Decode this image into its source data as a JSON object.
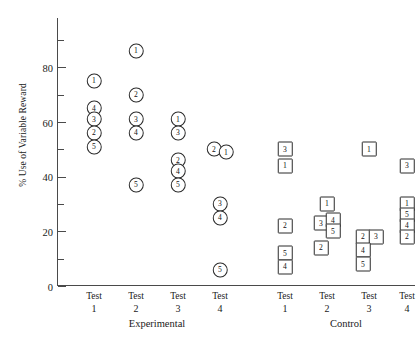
{
  "chart_data": {
    "type": "scatter",
    "title": "",
    "xlabel": "",
    "ylabel": "% Use of Variable Reward",
    "ylim": [
      0,
      90
    ],
    "yticks_major": [
      0,
      20,
      40,
      60,
      80
    ],
    "yticks_minor": [
      10,
      30,
      50,
      70,
      90
    ],
    "ytick_labels": [
      "0",
      "20",
      "40",
      "60",
      "80"
    ],
    "grid": false,
    "legend_position": "none",
    "x_categories": [
      {
        "line1": "Test",
        "line2": "1",
        "group": "Experimental",
        "marker": "circle"
      },
      {
        "line1": "Test",
        "line2": "2",
        "group": "Experimental",
        "marker": "circle"
      },
      {
        "line1": "Test",
        "line2": "3",
        "group": "Experimental",
        "marker": "circle"
      },
      {
        "line1": "Test",
        "line2": "4",
        "group": "Experimental",
        "marker": "circle"
      },
      {
        "line1": "Test",
        "line2": "1",
        "group": "Control",
        "marker": "square"
      },
      {
        "line1": "Test",
        "line2": "2",
        "group": "Control",
        "marker": "square"
      },
      {
        "line1": "Test",
        "line2": "3",
        "group": "Control",
        "marker": "square"
      },
      {
        "line1": "Test",
        "line2": "4",
        "group": "Control",
        "marker": "square"
      }
    ],
    "group_labels": [
      "Experimental",
      "Control"
    ],
    "points": [
      {
        "col": 0,
        "value": 75,
        "label": "1",
        "marker": "circle",
        "offset": 0
      },
      {
        "col": 0,
        "value": 65,
        "label": "4",
        "marker": "circle",
        "offset": 0
      },
      {
        "col": 0,
        "value": 61,
        "label": "3",
        "marker": "circle",
        "offset": 0
      },
      {
        "col": 0,
        "value": 56,
        "label": "2",
        "marker": "circle",
        "offset": 0
      },
      {
        "col": 0,
        "value": 51,
        "label": "5",
        "marker": "circle",
        "offset": 0
      },
      {
        "col": 1,
        "value": 86,
        "label": "1",
        "marker": "circle",
        "offset": 0
      },
      {
        "col": 1,
        "value": 70,
        "label": "2",
        "marker": "circle",
        "offset": 0
      },
      {
        "col": 1,
        "value": 61,
        "label": "3",
        "marker": "circle",
        "offset": 0
      },
      {
        "col": 1,
        "value": 56,
        "label": "4",
        "marker": "circle",
        "offset": 0
      },
      {
        "col": 1,
        "value": 37,
        "label": "5",
        "marker": "circle",
        "offset": 0
      },
      {
        "col": 2,
        "value": 61,
        "label": "1",
        "marker": "circle",
        "offset": 0
      },
      {
        "col": 2,
        "value": 56,
        "label": "3",
        "marker": "circle",
        "offset": 0
      },
      {
        "col": 2,
        "value": 46,
        "label": "2",
        "marker": "circle",
        "offset": 0
      },
      {
        "col": 2,
        "value": 42,
        "label": "4",
        "marker": "circle",
        "offset": 0
      },
      {
        "col": 2,
        "value": 37,
        "label": "5",
        "marker": "circle",
        "offset": 0
      },
      {
        "col": 3,
        "value": 50,
        "label": "2",
        "marker": "circle",
        "offset": -6
      },
      {
        "col": 3,
        "value": 49,
        "label": "1",
        "marker": "circle",
        "offset": 6
      },
      {
        "col": 3,
        "value": 30,
        "label": "3",
        "marker": "circle",
        "offset": 0
      },
      {
        "col": 3,
        "value": 25,
        "label": "4",
        "marker": "circle",
        "offset": 0
      },
      {
        "col": 3,
        "value": 6,
        "label": "5",
        "marker": "circle",
        "offset": 0
      },
      {
        "col": 4,
        "value": 50,
        "label": "3",
        "marker": "square",
        "offset": 0
      },
      {
        "col": 4,
        "value": 44,
        "label": "1",
        "marker": "square",
        "offset": 0
      },
      {
        "col": 4,
        "value": 22,
        "label": "2",
        "marker": "square",
        "offset": 0
      },
      {
        "col": 4,
        "value": 12,
        "label": "5",
        "marker": "square",
        "offset": 0
      },
      {
        "col": 4,
        "value": 7,
        "label": "4",
        "marker": "square",
        "offset": 0
      },
      {
        "col": 5,
        "value": 30,
        "label": "1",
        "marker": "square",
        "offset": 0
      },
      {
        "col": 5,
        "value": 23,
        "label": "3",
        "marker": "square",
        "offset": -6
      },
      {
        "col": 5,
        "value": 24,
        "label": "4",
        "marker": "square",
        "offset": 6
      },
      {
        "col": 5,
        "value": 20,
        "label": "5",
        "marker": "square",
        "offset": 6
      },
      {
        "col": 5,
        "value": 14,
        "label": "2",
        "marker": "square",
        "offset": -6
      },
      {
        "col": 6,
        "value": 50,
        "label": "1",
        "marker": "square",
        "offset": 0
      },
      {
        "col": 6,
        "value": 18,
        "label": "2",
        "marker": "square",
        "offset": -6
      },
      {
        "col": 6,
        "value": 18,
        "label": "3",
        "marker": "square",
        "offset": 7
      },
      {
        "col": 6,
        "value": 13,
        "label": "4",
        "marker": "square",
        "offset": -6
      },
      {
        "col": 6,
        "value": 8,
        "label": "5",
        "marker": "square",
        "offset": -6
      },
      {
        "col": 7,
        "value": 44,
        "label": "3",
        "marker": "square",
        "offset": 0
      },
      {
        "col": 7,
        "value": 30,
        "label": "1",
        "marker": "square",
        "offset": 0
      },
      {
        "col": 7,
        "value": 26,
        "label": "5",
        "marker": "square",
        "offset": 0
      },
      {
        "col": 7,
        "value": 22,
        "label": "4",
        "marker": "square",
        "offset": 0
      },
      {
        "col": 7,
        "value": 18,
        "label": "2",
        "marker": "square",
        "offset": 0
      }
    ]
  }
}
